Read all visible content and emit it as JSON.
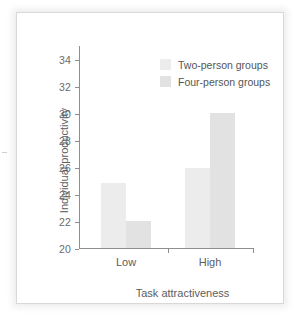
{
  "chart_data": {
    "type": "bar",
    "title": "",
    "xlabel": "Task attractiveness",
    "ylabel": "Individual productivity",
    "categories": [
      "Low",
      "High"
    ],
    "series": [
      {
        "name": "Two-person groups",
        "values": [
          24.8,
          25.9
        ],
        "color": "#ececec"
      },
      {
        "name": "Four-person groups",
        "values": [
          22.0,
          30.0
        ],
        "color": "#e2e2e2"
      }
    ],
    "ylim": [
      20,
      35
    ],
    "yticks": [
      20,
      22,
      24,
      26,
      28,
      30,
      32,
      34
    ],
    "ytick_labels": [
      "20",
      "22",
      "24",
      "26",
      "28",
      "30",
      "32",
      "34"
    ],
    "grid": false,
    "legend_position": "top-right",
    "axis_color": "#8e8e8e",
    "text_color": "#5d5d5d",
    "background": "#ffffff"
  },
  "legend": {
    "entries": [
      {
        "label": "Two-person groups"
      },
      {
        "label": "Four-person groups"
      }
    ]
  },
  "axes": {
    "y_label": "Individual productivity",
    "x_label": "Task attractiveness",
    "y_ticks": [
      "20",
      "22",
      "24",
      "26",
      "28",
      "30",
      "32",
      "34"
    ],
    "x_categories": [
      "Low",
      "High"
    ]
  }
}
